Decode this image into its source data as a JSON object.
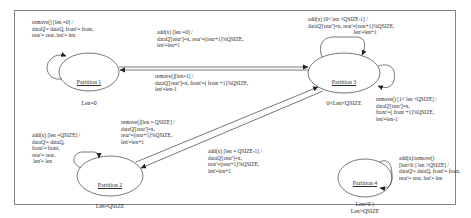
{
  "diagram": {
    "type": "state-machine",
    "colors": {
      "line": "#555555",
      "frame": "#777777",
      "text": "#2a2a2a",
      "background": "#ffffff"
    },
    "states": [
      {
        "id": "p1",
        "name": "Partition 1",
        "condition": "Len=0"
      },
      {
        "id": "p2",
        "name": "Partition 2",
        "condition": "Len=QSIZE"
      },
      {
        "id": "p3",
        "name": "Partition 3",
        "condition": "0<Len<QSIZE"
      },
      {
        "id": "p4",
        "name": "Partition 4",
        "condition": "Len<0 ||\nLen>QSIZE"
      }
    ],
    "transitions": [
      {
        "id": "t1",
        "from": "p1",
        "to": "p1",
        "label": "remove() [len =0] /\ndataQ'= dataQ, front'= front,\nrear'= rear, len'= len"
      },
      {
        "id": "t2",
        "from": "p1",
        "to": "p3",
        "label": "add(x) [len =0] /\ndataQ'[rear']=x, rear'=(rear+1)%QSIZE,\nlen'=len+1"
      },
      {
        "id": "t3",
        "from": "p3",
        "to": "p1",
        "label": "remove()[len=1] /\ndataQ'[rear']=x, front'=( front +1)%QSIZE,\nlen'=len-1"
      },
      {
        "id": "t4",
        "from": "p3",
        "to": "p3",
        "label": "add(x) [0< len <QSIZE-1] /\ndataQ'[rear']=x, rear'=(rear+1)%QSIZE,\n                                  len'=len+1"
      },
      {
        "id": "t5",
        "from": "p3",
        "to": "p3",
        "label": "remove() [1< len <QSIZE] /\ndataQ'[rear']=x,\nfront'=( front +1)%QSIZE,\nlen'=len-1"
      },
      {
        "id": "t6",
        "from": "p2",
        "to": "p2",
        "label": "add(x) [len =QSIZE] /\ndataQ'= dataQ,\nfront'= front,\nrear'= rear,\n len'= len"
      },
      {
        "id": "t7",
        "from": "p2",
        "to": "p3",
        "label": "remove()[len = QSIZE] /\ndataQ'[rear']=x,\nrear'=(rear+1)%QSIZE,\nlen'=len+1"
      },
      {
        "id": "t8",
        "from": "p3",
        "to": "p2",
        "label": "add(x) [len = QSIZE-1] /\ndataQ'[rear']=x,\nrear'=(rear+1)%QSIZE,\nlen'=len+1"
      },
      {
        "id": "t9",
        "from": "p4",
        "to": "p4",
        "label": "add(x)/remove()\n[len<0 || len >QSIZE] /\ndataQ'= dataQ, front'= front,\nrear'= rear, len'= len"
      }
    ]
  }
}
